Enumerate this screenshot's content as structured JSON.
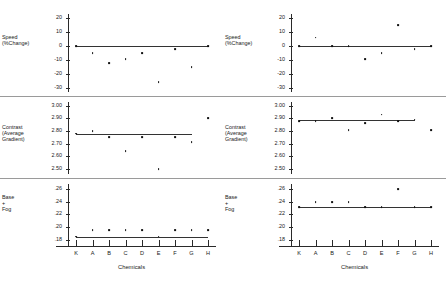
{
  "figure": {
    "x_axis_title": "Chemicals",
    "categories": [
      "K",
      "A",
      "B",
      "C",
      "D",
      "E",
      "F",
      "G",
      "H"
    ]
  },
  "panels": {
    "speed": {
      "label_line1": "Speed",
      "label_line2": "(%Change)"
    },
    "contrast": {
      "label_line1": "Contrast",
      "label_line2": "(Average",
      "label_line3": "Gradient)"
    },
    "base": {
      "label_line1": "Base",
      "label_line2": "+",
      "label_line3": "Fog"
    }
  },
  "ticks": {
    "speed": [
      "20",
      "10",
      "0",
      "-10",
      "-20",
      "-30"
    ],
    "contrast": [
      "3.00",
      "2.90",
      "2.80",
      "2.70",
      "2.60",
      "2.50"
    ],
    "base": [
      ".26",
      ".24",
      ".22",
      ".20",
      ".18"
    ]
  },
  "chart_data": [
    {
      "type": "scatter",
      "title": "Left chart",
      "xlabel": "Chemicals",
      "categories": [
        "K",
        "A",
        "B",
        "C",
        "D",
        "E",
        "F",
        "G",
        "H"
      ],
      "panels": [
        {
          "name": "speed",
          "ylabel": "Speed (%Change)",
          "ylim": [
            -33,
            23
          ],
          "yticks": [
            20,
            10,
            0,
            -10,
            -20,
            -30
          ],
          "values": [
            0,
            -5,
            -12,
            -9.5,
            -5,
            -26,
            -2,
            -15,
            0
          ],
          "reference_line": 0,
          "reference_line_span": [
            "K",
            "H"
          ]
        },
        {
          "name": "contrast",
          "ylabel": "Contrast (Average Gradient)",
          "ylim": [
            2.46,
            3.03
          ],
          "yticks": [
            3.0,
            2.9,
            2.8,
            2.7,
            2.6,
            2.5
          ],
          "values": [
            2.78,
            2.8,
            2.75,
            2.64,
            2.75,
            2.5,
            2.75,
            2.71,
            2.9
          ],
          "reference_line": 2.78,
          "reference_line_span": [
            "K",
            "G"
          ]
        },
        {
          "name": "base",
          "ylabel": "Base + Fog",
          "ylim": [
            0.17,
            0.268
          ],
          "yticks": [
            0.26,
            0.24,
            0.22,
            0.2,
            0.18
          ],
          "values": [
            0.185,
            0.195,
            0.195,
            0.195,
            0.195,
            0.185,
            0.195,
            0.195,
            0.195
          ],
          "reference_line": 0.185,
          "reference_line_span": [
            "K",
            "H"
          ]
        }
      ]
    },
    {
      "type": "scatter",
      "title": "Right chart",
      "xlabel": "Chemicals",
      "categories": [
        "K",
        "A",
        "B",
        "C",
        "D",
        "E",
        "F",
        "G",
        "H"
      ],
      "panels": [
        {
          "name": "speed",
          "ylabel": "Speed (%Change)",
          "ylim": [
            -33,
            23
          ],
          "yticks": [
            20,
            10,
            0,
            -10,
            -20,
            -30
          ],
          "values": [
            0,
            6,
            0,
            0,
            -9.5,
            -5,
            15,
            -2,
            0
          ],
          "reference_line": 0,
          "reference_line_span": [
            "K",
            "H"
          ]
        },
        {
          "name": "contrast",
          "ylabel": "Contrast (Average Gradient)",
          "ylim": [
            2.46,
            3.03
          ],
          "yticks": [
            3.0,
            2.9,
            2.8,
            2.7,
            2.6,
            2.5
          ],
          "values": [
            2.88,
            2.88,
            2.9,
            2.81,
            2.86,
            2.93,
            2.88,
            2.89,
            2.81
          ],
          "reference_line": 2.885,
          "reference_line_span": [
            "K",
            "G"
          ]
        },
        {
          "name": "base",
          "ylabel": "Base + Fog",
          "ylim": [
            0.17,
            0.268
          ],
          "yticks": [
            0.26,
            0.24,
            0.22,
            0.2,
            0.18
          ],
          "values": [
            0.231,
            0.24,
            0.24,
            0.24,
            0.231,
            0.231,
            0.26,
            0.231,
            0.231
          ],
          "reference_line": 0.231,
          "reference_line_span": [
            "K",
            "H"
          ]
        }
      ]
    }
  ]
}
